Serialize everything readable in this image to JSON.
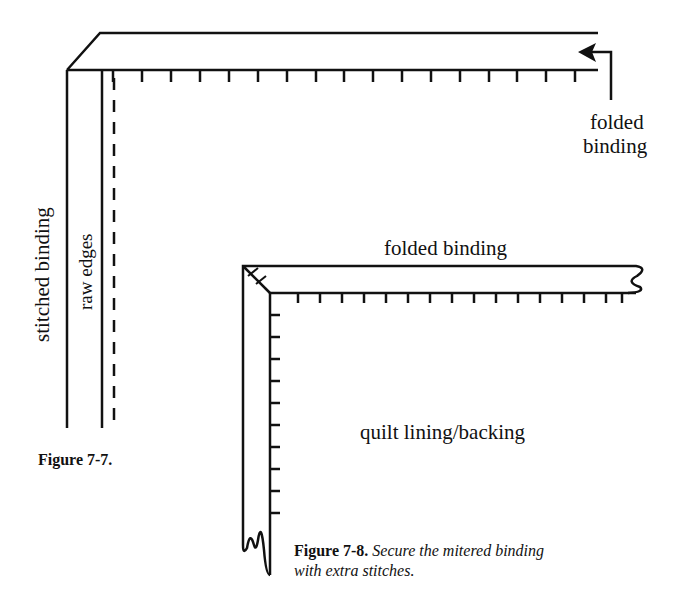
{
  "figure_7_7": {
    "labels": {
      "stitched_binding": "stitched binding",
      "raw_edges": "raw edges",
      "folded_binding_line1": "folded",
      "folded_binding_line2": "binding"
    },
    "caption": "Figure 7-7."
  },
  "figure_7_8": {
    "labels": {
      "folded_binding": "folded binding",
      "quilt_lining": "quilt lining/backing"
    },
    "caption_bold": "Figure 7-8.",
    "caption_italic_line1": "Secure the mitered binding",
    "caption_italic_line2": "with extra stitches."
  },
  "colors": {
    "ink": "#111111",
    "background": "#ffffff"
  }
}
